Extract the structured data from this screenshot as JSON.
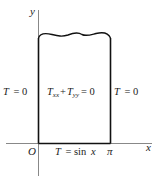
{
  "diagram": {
    "axes": {
      "x_label": "x",
      "y_label": "y",
      "origin_label": "O",
      "x_tick_label": "π"
    },
    "region": {
      "interior_equation": {
        "var": "T",
        "sub1": "xx",
        "plus": "+",
        "sub2": "yy",
        "eq": "= 0"
      },
      "left_boundary": {
        "var": "T",
        "eq": "= 0"
      },
      "right_boundary": {
        "var": "T",
        "eq": "= 0"
      },
      "bottom_boundary": {
        "var": "T",
        "eq": "= sin",
        "arg": "x"
      }
    },
    "colors": {
      "axis": "#888888",
      "boundary": "#111111",
      "text": "#222222"
    }
  }
}
